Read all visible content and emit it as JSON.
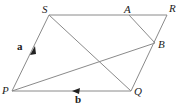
{
  "diagram": {
    "type": "parallelogram-vectors",
    "colors": {
      "line": "#8a8a8a",
      "text": "#222222",
      "background": "#ffffff"
    },
    "vertices": {
      "S": {
        "label": "S",
        "x": 49,
        "y": 15,
        "lx": 42,
        "ly": 13
      },
      "A": {
        "label": "A",
        "x": 129,
        "y": 15,
        "lx": 124,
        "ly": 13
      },
      "R": {
        "label": "R",
        "x": 167,
        "y": 15,
        "lx": 169,
        "ly": 12
      },
      "B": {
        "label": "B",
        "x": 155,
        "y": 43,
        "lx": 158,
        "ly": 48
      },
      "P": {
        "label": "P",
        "x": 12,
        "y": 91,
        "lx": 2,
        "ly": 94
      },
      "Q": {
        "label": "Q",
        "x": 131,
        "y": 91,
        "lx": 134,
        "ly": 95
      }
    },
    "vectors": {
      "a": {
        "label": "a",
        "on_edge": "PS",
        "lx": 17,
        "ly": 50
      },
      "b": {
        "label": "b",
        "on_edge": "PQ",
        "lx": 75,
        "ly": 103
      }
    },
    "segments": [
      "PS",
      "SR",
      "RQ",
      "QP",
      "SQ",
      "PB",
      "AB"
    ]
  }
}
